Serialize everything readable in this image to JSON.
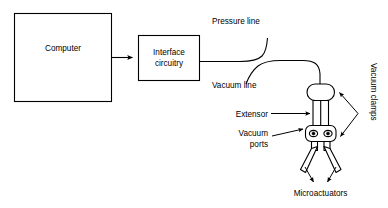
{
  "diagram": {
    "background_color": "#ffffff",
    "line_color": "#000000",
    "blocks": [
      {
        "id": "computer",
        "label": "Computer"
      },
      {
        "id": "interface",
        "label": "Interface\ncircuitry",
        "label_line1": "Interface",
        "label_line2": "circuitry"
      }
    ],
    "annotations": [
      {
        "id": "pressure-line",
        "label": "Pressure line"
      },
      {
        "id": "vacuum-line",
        "label": "Vacuum line"
      },
      {
        "id": "vacuum-clamps",
        "label": "Vacuum clamps",
        "orientation": "vertical"
      },
      {
        "id": "extensor",
        "label": "Extensor"
      },
      {
        "id": "vacuum-ports",
        "label": "Vacuum\nports",
        "label_line1": "Vacuum",
        "label_line2": "ports"
      },
      {
        "id": "microactuators",
        "label": "Microactuators"
      }
    ]
  }
}
